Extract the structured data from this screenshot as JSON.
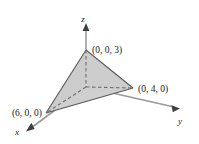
{
  "figure": {
    "background_color": "#ffffff",
    "axes": {
      "z": {
        "label": "z",
        "label_x": 86,
        "label_y": 20
      },
      "y": {
        "label": "y",
        "label_x": 181,
        "label_y": 122
      },
      "x": {
        "label": "x",
        "label_y": 134,
        "label_x": 17
      }
    },
    "vertices": [
      {
        "id": "z-intercept",
        "label": "(0, 0, 3)",
        "px": 86,
        "py": 50,
        "label_x": 93,
        "label_y": 50
      },
      {
        "id": "y-intercept",
        "label": "(0, 4, 0)",
        "px": 133,
        "py": 88,
        "label_x": 139,
        "label_y": 92
      },
      {
        "id": "x-intercept",
        "label": "(6, 0, 0)",
        "px": 46,
        "py": 113,
        "label_x": 6,
        "label_y": 113
      },
      {
        "id": "origin",
        "label": "",
        "px": 86,
        "py": 87,
        "label_x": 0,
        "label_y": 0
      }
    ],
    "solid": {
      "name": "tetrahedron",
      "fill_color": "#cfcfcf",
      "fill_color_light": "#dcdcdc",
      "edge_color": "#4a4a4a",
      "hidden_edge_style": "dashed"
    },
    "colors": {
      "axis": "#808080",
      "text": "#1a1a1a",
      "arrow": "#3a3a3a"
    }
  }
}
